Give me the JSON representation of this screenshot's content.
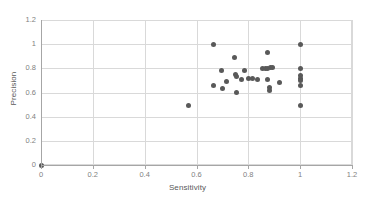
{
  "chart_data": {
    "type": "scatter",
    "title": "",
    "xlabel": "Sensitivity",
    "ylabel": "Precision",
    "xlim": [
      0,
      1.2
    ],
    "ylim": [
      0,
      1.2
    ],
    "xticks": [
      "0",
      "0.2",
      "0.4",
      "0.6",
      "0.8",
      "1",
      "1.2"
    ],
    "xtick_values": [
      0,
      0.2,
      0.4,
      0.6,
      0.8,
      1,
      1.2
    ],
    "yticks": [
      "0",
      "0.2",
      "0.4",
      "0.6",
      "0.8",
      "1",
      "1.2"
    ],
    "ytick_values": [
      0,
      0.2,
      0.4,
      0.6,
      0.8,
      1,
      1.2
    ],
    "grid": true,
    "grid_axes": "both",
    "legend": "none",
    "marker_color": "#595959",
    "marker_size": 5,
    "gridline_color": "#d9d9d9",
    "axis_color": "#a6a6a6",
    "series": [
      {
        "name": "Models",
        "points": [
          [
            0.0,
            0.0
          ],
          [
            0.57,
            0.49
          ],
          [
            0.665,
            0.995
          ],
          [
            0.665,
            0.66
          ],
          [
            0.695,
            0.78
          ],
          [
            0.7,
            0.635
          ],
          [
            0.715,
            0.695
          ],
          [
            0.745,
            0.89
          ],
          [
            0.75,
            0.745
          ],
          [
            0.755,
            0.735
          ],
          [
            0.755,
            0.6
          ],
          [
            0.785,
            0.785
          ],
          [
            0.775,
            0.705
          ],
          [
            0.8,
            0.715
          ],
          [
            0.815,
            0.715
          ],
          [
            0.835,
            0.705
          ],
          [
            0.855,
            0.795
          ],
          [
            0.865,
            0.8
          ],
          [
            0.875,
            0.8
          ],
          [
            0.875,
            0.93
          ],
          [
            0.885,
            0.805
          ],
          [
            0.895,
            0.81
          ],
          [
            0.875,
            0.705
          ],
          [
            0.88,
            0.64
          ],
          [
            0.88,
            0.615
          ],
          [
            0.92,
            0.68
          ],
          [
            1.0,
            0.995
          ],
          [
            1.0,
            0.795
          ],
          [
            1.0,
            0.74
          ],
          [
            1.0,
            0.72
          ],
          [
            1.0,
            0.7
          ],
          [
            1.0,
            0.66
          ],
          [
            1.0,
            0.49
          ]
        ]
      }
    ]
  }
}
